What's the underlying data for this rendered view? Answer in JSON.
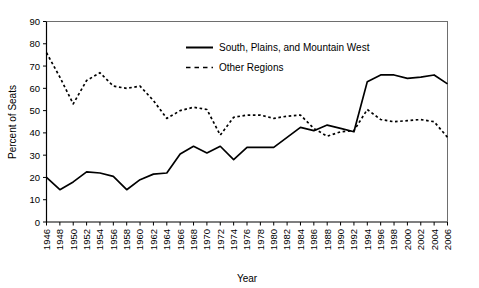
{
  "chart_data": {
    "type": "line",
    "title": "",
    "xlabel": "Year",
    "ylabel": "Percent of Seats",
    "xlim": [
      1946,
      2006
    ],
    "ylim": [
      0,
      90
    ],
    "grid": false,
    "legend_position": "top-center",
    "x": [
      1946,
      1948,
      1950,
      1952,
      1954,
      1956,
      1958,
      1960,
      1962,
      1964,
      1966,
      1968,
      1970,
      1972,
      1974,
      1976,
      1978,
      1980,
      1982,
      1984,
      1986,
      1988,
      1990,
      1992,
      1994,
      1996,
      1998,
      2000,
      2002,
      2004,
      2006
    ],
    "xticks": [
      "1946",
      "1948",
      "1950",
      "1952",
      "1954",
      "1956",
      "1958",
      "1960",
      "1962",
      "1964",
      "1966",
      "1968",
      "1970",
      "1972",
      "1974",
      "1976",
      "1978",
      "1980",
      "1982",
      "1984",
      "1986",
      "1988",
      "1990",
      "1992",
      "1994",
      "1996",
      "1998",
      "2000",
      "2002",
      "2004",
      "2006"
    ],
    "yticks": [
      "0",
      "10",
      "20",
      "30",
      "40",
      "50",
      "60",
      "70",
      "80",
      "90"
    ],
    "series": [
      {
        "name": "South, Plains, and Mountain West",
        "style": "solid",
        "color": "#000000",
        "values": [
          20,
          14.5,
          18,
          22.5,
          22,
          20.5,
          14.5,
          19,
          21.5,
          22,
          30.5,
          34,
          31,
          34,
          28,
          33.5,
          33.5,
          33.5,
          38,
          42.5,
          41,
          43.5,
          42,
          40.5,
          63,
          66,
          66,
          64.5,
          65,
          66,
          62
        ]
      },
      {
        "name": "Other Regions",
        "style": "dashed",
        "color": "#000000",
        "values": [
          76,
          65,
          53,
          63.5,
          67,
          61,
          60,
          61,
          54.5,
          46.5,
          50,
          51.5,
          50.5,
          39,
          47,
          48,
          48,
          46.5,
          47.5,
          48,
          42,
          38.5,
          40.5,
          41,
          50.5,
          46,
          45,
          45.5,
          46,
          45,
          38
        ]
      }
    ],
    "legend": [
      {
        "label": "South, Plains, and Mountain West",
        "style": "solid"
      },
      {
        "label": "Other Regions",
        "style": "dashed"
      }
    ]
  }
}
